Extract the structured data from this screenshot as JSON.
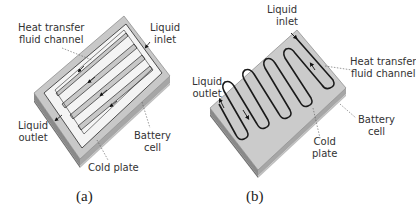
{
  "figure": {
    "panels": [
      {
        "id": "a",
        "caption": "(a)",
        "channel_type": "parallel U-turn channels",
        "labels": {
          "heat_transfer_fluid_channel": [
            "Heat transfer",
            "fluid channel"
          ],
          "liquid_inlet": [
            "Liquid",
            "inlet"
          ],
          "liquid_outlet": [
            "Liquid",
            "outlet"
          ],
          "battery_cell": [
            "Battery",
            "cell"
          ],
          "cold_plate": [
            "Cold plate"
          ]
        }
      },
      {
        "id": "b",
        "caption": "(b)",
        "channel_type": "serpentine channel",
        "labels": {
          "liquid_inlet": [
            "Liquid",
            "inlet"
          ],
          "liquid_outlet": [
            "Liquid",
            "outlet"
          ],
          "heat_transfer_fluid_channel": [
            "Heat transfer",
            "fluid channel"
          ],
          "battery_cell": [
            "Battery",
            "cell"
          ],
          "cold_plate": [
            "Cold",
            "plate"
          ]
        }
      }
    ],
    "colors": {
      "plate_top": "#c8c8c8",
      "plate_side_dark": "#8a8a8a",
      "plate_side_light": "#b4b4b4",
      "channel_fill": "#f4f4f4",
      "channel_stroke": "#2a2a2a",
      "label_text": "#333333"
    }
  }
}
